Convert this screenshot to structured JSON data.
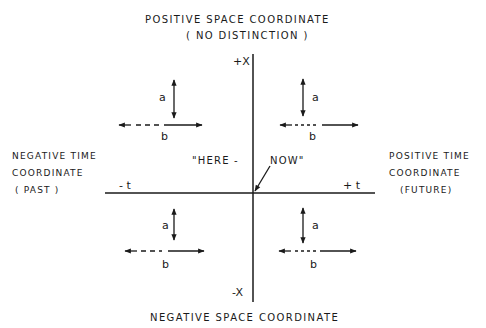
{
  "diagram": {
    "top_label": {
      "line1": "POSITIVE SPACE COORDINATE",
      "line2": "( NO  DISTINCTION )"
    },
    "bottom_label": "NEGATIVE  SPACE  COORDINATE",
    "left_label": {
      "line1": "NEGATIVE  TIME",
      "line2": "COORDINATE",
      "line3": "( PAST )"
    },
    "right_label": {
      "line1": "POSITIVE  TIME",
      "line2": "COORDINATE",
      "line3": "(FUTURE)"
    },
    "axis_labels": {
      "pos_x": "+X",
      "neg_x": "-X",
      "neg_t": "- t",
      "pos_t": "+ t"
    },
    "origin_label": {
      "left": "\"HERE  -",
      "right": "NOW\""
    },
    "quadrants": [
      {
        "name": "upper-left",
        "a": "a",
        "b": "b"
      },
      {
        "name": "upper-right",
        "a": "a",
        "b": "b"
      },
      {
        "name": "lower-left",
        "a": "a",
        "b": "b"
      },
      {
        "name": "lower-right",
        "a": "a",
        "b": "b"
      }
    ],
    "colors": {
      "ink": "#1a1a1a",
      "background": "#ffffff"
    }
  }
}
